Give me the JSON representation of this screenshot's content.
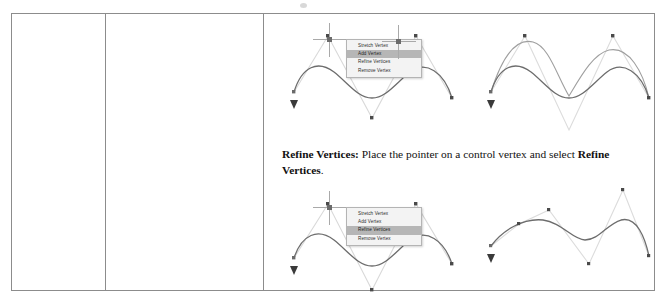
{
  "document": {
    "type": "scanned-manual-page-table",
    "table": {
      "columns": [
        "empty-left",
        "empty-middle",
        "content"
      ],
      "cells": {
        "left": "",
        "middle": "",
        "content": "figures-and-caption"
      }
    }
  },
  "caption": {
    "lead_label": "Refine Vertices:",
    "body_before": " Place the pointer on a control vertex and select ",
    "emphasis": "Refine Vertices",
    "body_after": "."
  },
  "context_menus": [
    {
      "id": "menu-add-vertex",
      "items": [
        {
          "label": "Stretch Vertex",
          "selected": false
        },
        {
          "label": "Add Vertex",
          "selected": true
        },
        {
          "label": "Refine Vertices",
          "selected": false
        },
        {
          "label": "Remove Vertex",
          "selected": false
        }
      ]
    },
    {
      "id": "menu-refine-vertices",
      "items": [
        {
          "label": "Stretch Vertex",
          "selected": false
        },
        {
          "label": "Add Vertex",
          "selected": false
        },
        {
          "label": "Refine Vertices",
          "selected": true
        },
        {
          "label": "Remove Vertex",
          "selected": false
        }
      ]
    }
  ],
  "figures": [
    {
      "id": "figure-top-left",
      "description": "Spline with control polygon, crosshair pointer at a control vertex, context menu open with Add Vertex highlighted"
    },
    {
      "id": "figure-top-right",
      "description": "Spline showing preview of added vertex, original and modified curves with crosshair pointer"
    },
    {
      "id": "figure-bottom-left",
      "description": "Spline with control polygon, crosshair pointer at a control vertex, context menu open with Refine Vertices highlighted"
    },
    {
      "id": "figure-bottom-right",
      "description": "Refined spline with additional control vertices along the control polygon"
    }
  ],
  "colors": {
    "curve_dark": "#595959",
    "curve_light": "#9a9a9a",
    "control_polygon": "#d5d5d5",
    "vertex_marker": "#4a4a4a",
    "menu_background": "#f3f3f3",
    "menu_highlight": "#b6b6b6",
    "menu_border": "#b4b4b4",
    "table_border": "#8c8c8c",
    "crosshair": "#a9a9a9"
  }
}
